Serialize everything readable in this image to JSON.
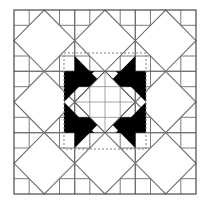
{
  "figure": {
    "name": "quilt-block-star-diagram",
    "title": "Star quilt block pattern",
    "canvas": {
      "width": 210,
      "height": 207
    },
    "background_color": "#ffffff"
  },
  "grid": {
    "origin_x": 14,
    "origin_y": 10,
    "width": 182,
    "height": 184,
    "blocks_across": 3,
    "blocks_down": 3,
    "cells_per_block": 4,
    "cells_across": 12,
    "cells_down": 12,
    "cell_line_color": "#7b7b7b",
    "cell_line_width": 1.0,
    "outer_border_color": "#4a4a4a",
    "outer_border_width": 1.2
  },
  "diamonds": {
    "label": "inscribed-diamond",
    "stroke_color": "#6e6e6e",
    "stroke_width": 1.1,
    "fill": "#ffffff",
    "count": 9,
    "note": "One diamond inscribed in each of the nine blocks, connecting block edge midpoints"
  },
  "star": {
    "label": "center-star",
    "fill_color": "#000000",
    "center_diamond_fill": "#ffffff",
    "points": 4,
    "note": "Four black hourglass star points around a white center diamond"
  },
  "selection": {
    "label": "dotted-selection-boundary",
    "x": 64,
    "y": 53,
    "width": 82,
    "height": 96,
    "stroke_color": "#808080",
    "stroke_width": 1.0,
    "dash": "2,2"
  },
  "colors": {
    "black": "#000000",
    "white": "#ffffff",
    "grid_gray": "#7b7b7b",
    "border_gray": "#4a4a4a",
    "dotted_gray": "#808080"
  }
}
